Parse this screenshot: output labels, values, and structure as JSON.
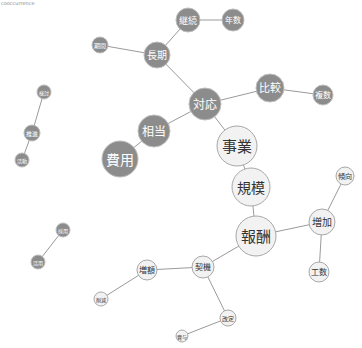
{
  "caption": "cooccurrence",
  "nodes": [
    {
      "id": "keizoku",
      "label": "継続",
      "x": 188,
      "y": 20,
      "r": 12,
      "tone": "dark"
    },
    {
      "id": "nensu",
      "label": "年数",
      "x": 233,
      "y": 20,
      "r": 11,
      "tone": "dark"
    },
    {
      "id": "kikan",
      "label": "期間",
      "x": 100,
      "y": 45,
      "r": 8,
      "tone": "dark"
    },
    {
      "id": "choki",
      "label": "長期",
      "x": 157,
      "y": 55,
      "r": 13,
      "tone": "dark"
    },
    {
      "id": "hikaku",
      "label": "比較",
      "x": 270,
      "y": 88,
      "r": 14,
      "tone": "dark"
    },
    {
      "id": "fukusu",
      "label": "複数",
      "x": 323,
      "y": 95,
      "r": 10,
      "tone": "dark"
    },
    {
      "id": "taio",
      "label": "対応",
      "x": 205,
      "y": 104,
      "r": 16,
      "tone": "dark"
    },
    {
      "id": "soto",
      "label": "相当",
      "x": 154,
      "y": 131,
      "r": 16,
      "tone": "dark"
    },
    {
      "id": "hiyo",
      "label": "費用",
      "x": 120,
      "y": 159,
      "r": 18,
      "tone": "dark"
    },
    {
      "id": "jigyo",
      "label": "事業",
      "x": 237,
      "y": 146,
      "r": 20,
      "tone": "light"
    },
    {
      "id": "kibo",
      "label": "規模",
      "x": 251,
      "y": 187,
      "r": 19,
      "tone": "light"
    },
    {
      "id": "keiko",
      "label": "傾向",
      "x": 345,
      "y": 176,
      "r": 9,
      "tone": "light"
    },
    {
      "id": "zoka",
      "label": "増加",
      "x": 322,
      "y": 222,
      "r": 13,
      "tone": "light"
    },
    {
      "id": "hoshu",
      "label": "報酬",
      "x": 256,
      "y": 236,
      "r": 20,
      "tone": "light"
    },
    {
      "id": "kosu",
      "label": "工数",
      "x": 319,
      "y": 272,
      "r": 10,
      "tone": "light"
    },
    {
      "id": "zogaku",
      "label": "増額",
      "x": 147,
      "y": 270,
      "r": 10,
      "tone": "light"
    },
    {
      "id": "keiki",
      "label": "契機",
      "x": 203,
      "y": 267,
      "r": 11,
      "tone": "light"
    },
    {
      "id": "kaitei",
      "label": "改定",
      "x": 228,
      "y": 318,
      "r": 8,
      "tone": "light"
    },
    {
      "id": "sakugen",
      "label": "削減",
      "x": 101,
      "y": 299,
      "r": 7,
      "tone": "light"
    },
    {
      "id": "shoyo",
      "label": "賞与",
      "x": 182,
      "y": 336,
      "r": 6,
      "tone": "light"
    },
    {
      "id": "kento",
      "label": "検討",
      "x": 44,
      "y": 92,
      "r": 7,
      "tone": "dark"
    },
    {
      "id": "suishin",
      "label": "推進",
      "x": 32,
      "y": 133,
      "r": 8,
      "tone": "dark"
    },
    {
      "id": "katsudo",
      "label": "活動",
      "x": 22,
      "y": 160,
      "r": 7,
      "tone": "dark"
    },
    {
      "id": "saiyo",
      "label": "採用",
      "x": 63,
      "y": 230,
      "r": 7,
      "tone": "dark"
    },
    {
      "id": "katsuyo",
      "label": "活用",
      "x": 38,
      "y": 262,
      "r": 7,
      "tone": "dark"
    }
  ],
  "edges": [
    [
      "keizoku",
      "nensu"
    ],
    [
      "keizoku",
      "choki"
    ],
    [
      "kikan",
      "choki"
    ],
    [
      "choki",
      "taio"
    ],
    [
      "taio",
      "hikaku"
    ],
    [
      "hikaku",
      "fukusu"
    ],
    [
      "taio",
      "soto"
    ],
    [
      "soto",
      "hiyo"
    ],
    [
      "taio",
      "jigyo"
    ],
    [
      "jigyo",
      "kibo"
    ],
    [
      "kibo",
      "hoshu"
    ],
    [
      "hoshu",
      "zoka"
    ],
    [
      "zoka",
      "keiko"
    ],
    [
      "zoka",
      "kosu"
    ],
    [
      "hoshu",
      "keiki"
    ],
    [
      "keiki",
      "zogaku"
    ],
    [
      "keiki",
      "kaitei"
    ],
    [
      "zogaku",
      "sakugen"
    ],
    [
      "kaitei",
      "shoyo"
    ],
    [
      "kento",
      "suishin"
    ],
    [
      "suishin",
      "katsudo"
    ],
    [
      "saiyo",
      "katsuyo"
    ]
  ]
}
